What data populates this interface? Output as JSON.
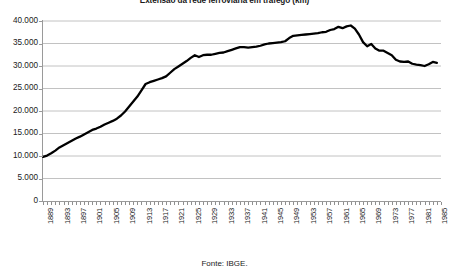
{
  "chart_data": {
    "type": "line",
    "title": "Extensão da rede ferroviária em tráfego (km)",
    "source_note": "Fonte: IBGE.",
    "xlabel": "",
    "ylabel": "",
    "ylim": [
      0,
      40000
    ],
    "xlim": [
      1889,
      1986
    ],
    "grid": true,
    "legend": "none",
    "y_ticks": [
      40000,
      35000,
      30000,
      25000,
      20000,
      15000,
      10000,
      5000,
      0
    ],
    "y_tick_labels": [
      "40.000",
      "35.000",
      "30.000",
      "25.000",
      "20.000",
      "15.000",
      "10.000",
      "5.000",
      "0"
    ],
    "x_tick_labels": [
      "1889",
      "1893",
      "1897",
      "1901",
      "1905",
      "1909",
      "1913",
      "1917",
      "1921",
      "1925",
      "1929",
      "1933",
      "1937",
      "1941",
      "1945",
      "1949",
      "1953",
      "1957",
      "1961",
      "1965",
      "1969",
      "1973",
      "1977",
      "1981",
      "1985"
    ],
    "x_tick_step_years": 4,
    "line_color": "#000000",
    "line_width_px": 2.3,
    "grid_color": "#b3b3b3",
    "axis_color": "#9a9a9a",
    "series": [
      {
        "name": "Extensão da rede ferroviária em tráfego (km)",
        "x": [
          1889,
          1890,
          1891,
          1892,
          1893,
          1894,
          1895,
          1896,
          1897,
          1898,
          1899,
          1900,
          1901,
          1902,
          1903,
          1904,
          1905,
          1906,
          1907,
          1908,
          1909,
          1910,
          1911,
          1912,
          1913,
          1914,
          1915,
          1916,
          1917,
          1918,
          1919,
          1920,
          1921,
          1922,
          1923,
          1924,
          1925,
          1926,
          1927,
          1928,
          1929,
          1930,
          1931,
          1932,
          1933,
          1934,
          1935,
          1936,
          1937,
          1938,
          1939,
          1940,
          1941,
          1942,
          1943,
          1944,
          1945,
          1946,
          1947,
          1948,
          1949,
          1950,
          1951,
          1952,
          1953,
          1954,
          1955,
          1956,
          1957,
          1958,
          1959,
          1960,
          1961,
          1962,
          1963,
          1964,
          1965,
          1966,
          1967,
          1968,
          1969,
          1970,
          1971,
          1972,
          1973,
          1974,
          1975,
          1976,
          1977,
          1978,
          1979,
          1980,
          1981,
          1982,
          1983,
          1984,
          1985
        ],
        "values": [
          9800,
          10100,
          10600,
          11200,
          11900,
          12400,
          12900,
          13400,
          13900,
          14300,
          14800,
          15300,
          15800,
          16100,
          16500,
          17000,
          17400,
          17800,
          18300,
          19000,
          19900,
          21000,
          22100,
          23200,
          24600,
          26000,
          26400,
          26700,
          27000,
          27300,
          27700,
          28500,
          29300,
          29900,
          30500,
          31100,
          31800,
          32400,
          32000,
          32400,
          32500,
          32500,
          32700,
          32900,
          33000,
          33300,
          33600,
          33900,
          34200,
          34200,
          34100,
          34200,
          34300,
          34500,
          34800,
          35000,
          35100,
          35200,
          35300,
          35500,
          36200,
          36700,
          36800,
          36900,
          37000,
          37100,
          37200,
          37300,
          37500,
          37600,
          38000,
          38200,
          38700,
          38400,
          38800,
          39000,
          38300,
          37000,
          35300,
          34400,
          34900,
          33900,
          33400,
          33400,
          32900,
          32400,
          31400,
          31000,
          30900,
          31000,
          30500,
          30300,
          30200,
          30000,
          30400,
          30900,
          30700
        ]
      }
    ]
  }
}
